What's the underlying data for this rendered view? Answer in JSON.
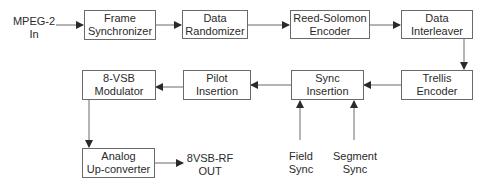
{
  "diagram": {
    "title": "",
    "blocks": {
      "frame_sync": "Frame\nSynchronizer",
      "data_randomizer": "Data\nRandomizer",
      "reed_solomon": "Reed-Solomon\nEncoder",
      "data_interleaver": "Data\nInterleaver",
      "trellis_encoder": "Trellis\nEncoder",
      "sync_insertion": "Sync\nInsertion",
      "pilot_insertion": "Pilot\nInsertion",
      "vsb_modulator": "8-VSB\nModulator",
      "upconverter": "Analog\nUp-converter"
    },
    "labels": {
      "input": "MPEG-2\nIn",
      "output": "8VSB-RF\nOUT",
      "field_sync": "Field\nSync",
      "segment_sync": "Segment\nSync"
    },
    "colors": {
      "line": "#6a6a6a",
      "text": "#2a2a2a",
      "background": "#ffffff"
    }
  }
}
